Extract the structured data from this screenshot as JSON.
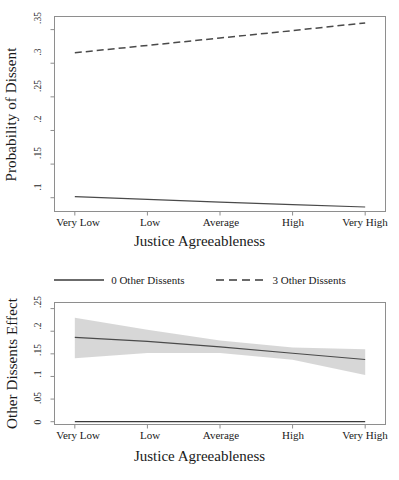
{
  "figure": {
    "panels": [
      "probability-of-dissent",
      "other-dissents-effect"
    ]
  },
  "legend": {
    "position": "between-panels",
    "entries": [
      {
        "label": "0 Other Dissents",
        "style": "solid"
      },
      {
        "label": "3 Other Dissents",
        "style": "dashed"
      }
    ]
  },
  "chart_data": [
    {
      "type": "line",
      "panel": "top",
      "title": "",
      "xlabel": "Justice Agreeableness",
      "ylabel": "Probability of Dissent",
      "categories": [
        "Very Low",
        "Low",
        "Average",
        "High",
        "Very High"
      ],
      "x": [
        1,
        2,
        3,
        4,
        5
      ],
      "xlim": [
        0.72,
        5.28
      ],
      "ylim": [
        0.0795,
        0.3695
      ],
      "yticks": [
        0.1,
        0.15,
        0.2,
        0.25,
        0.3,
        0.35
      ],
      "ytick_labels": [
        ".1",
        ".15",
        ".2",
        ".25",
        ".3",
        ".35"
      ],
      "grid": false,
      "legend_position": "below-panel",
      "series": [
        {
          "name": "0 Other Dissents",
          "style": "solid",
          "values": [
            0.1015,
            0.0975,
            0.0935,
            0.0897,
            0.0862
          ]
        },
        {
          "name": "3 Other Dissents",
          "style": "dashed",
          "values": [
            0.3155,
            0.3265,
            0.3375,
            0.3485,
            0.36
          ]
        }
      ]
    },
    {
      "type": "line",
      "panel": "bottom",
      "title": "",
      "xlabel": "Justice Agreeableness",
      "ylabel": "Other Dissents Effect",
      "categories": [
        "Very Low",
        "Low",
        "Average",
        "High",
        "Very High"
      ],
      "x": [
        1,
        2,
        3,
        4,
        5
      ],
      "xlim": [
        0.72,
        5.28
      ],
      "ylim": [
        -0.0062,
        0.2635
      ],
      "yticks": [
        0,
        0.05,
        0.1,
        0.15,
        0.2,
        0.25
      ],
      "ytick_labels": [
        "0",
        ".05",
        ".1",
        ".15",
        ".2",
        ".25"
      ],
      "grid": false,
      "legend_position": "above-panel",
      "series": [
        {
          "name": "Other Dissents Effect",
          "style": "solid",
          "values": [
            0.1862,
            0.1775,
            0.1655,
            0.1513,
            0.1375
          ]
        },
        {
          "name": "Zero Reference",
          "style": "solid",
          "values": [
            0,
            0,
            0,
            0,
            0
          ]
        }
      ],
      "confidence_band": {
        "name": "95% Confidence Interval",
        "upper": [
          0.23,
          0.203,
          0.1795,
          0.164,
          0.16
        ],
        "lower": [
          0.14,
          0.152,
          0.152,
          0.137,
          0.103
        ]
      }
    }
  ]
}
